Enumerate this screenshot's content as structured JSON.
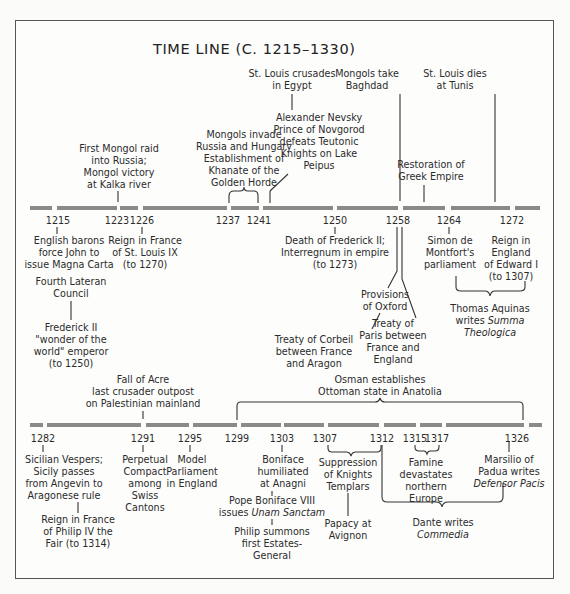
{
  "title": "TIME LINE (C. 1215–1330)",
  "timeline_1": {
    "years": [
      "1215",
      "1223",
      "1226",
      "1237",
      "1241",
      "1250",
      "1258",
      "1264",
      "1272"
    ],
    "above": {
      "mongol_raid": [
        "First Mongol raid",
        "into Russia;",
        "Mongol victory",
        "at Kalka river"
      ],
      "mongols_invade": [
        "Mongols invade",
        "Russia and Hungary",
        "Establishment of",
        "Khanate of the",
        "Golden Horde"
      ],
      "nevsky": [
        "Alexander Nevsky",
        "Prince of Novgorod",
        "defeats Teutonic",
        "Knights on Lake",
        "Peipus"
      ],
      "st_louis_egypt": [
        "St. Louis crusades",
        "in Egypt"
      ],
      "mongols_baghdad": [
        "Mongols take",
        "Baghdad"
      ],
      "greek_empire": [
        "Restoration of",
        "Greek Empire"
      ],
      "st_louis_tunis": [
        "St. Louis dies",
        "at Tunis"
      ]
    },
    "below": {
      "magna_carta": [
        "English barons",
        "force John to",
        "issue Magna Carta"
      ],
      "lateran": [
        "Fourth Lateran",
        "Council"
      ],
      "frederick": [
        "Frederick II",
        "\"wonder of the",
        "world\" emperor",
        "(to 1250)"
      ],
      "st_louis_reign": [
        "Reign in France",
        "of St. Louis IX",
        "(to 1270)"
      ],
      "death_frederick": [
        "Death of Frederick II;",
        "Interregnum in empire",
        "(to 1273)"
      ],
      "oxford": [
        "Provisions",
        "of Oxford"
      ],
      "corbeil": [
        "Treaty of Corbeil",
        "between France",
        "and Aragon"
      ],
      "paris": [
        "Treaty of",
        "Paris between",
        "France and",
        "England"
      ],
      "montfort": [
        "Simon de",
        "Montfort's",
        "parliament"
      ],
      "edward": [
        "Reign in",
        "England",
        "of Edward I",
        "(to 1307)"
      ],
      "aquinas": [
        "Thomas Aquinas",
        "writes ",
        "Summa",
        "Theologica"
      ]
    }
  },
  "timeline_2": {
    "years": [
      "1282",
      "1291",
      "1295",
      "1299",
      "1303",
      "1307",
      "1312",
      "1315",
      "1317",
      "1326"
    ],
    "above": {
      "acre": [
        "Fall of Acre",
        "last crusader outpost",
        "on Palestinian mainland"
      ],
      "osman": [
        "Osman establishes",
        "Ottoman state in Anatolia"
      ]
    },
    "below": {
      "vespers": [
        "Sicilian Vespers;",
        "Sicily passes",
        "from Angevin to",
        "Aragonese rule"
      ],
      "philip_iv": [
        "Reign in France",
        "of Philip IV the",
        "Fair (to 1314)"
      ],
      "swiss": [
        "Perpetual",
        "Compact",
        "among",
        "Swiss",
        "Cantons"
      ],
      "model_parl": [
        "Model",
        "Parliament",
        "in England"
      ],
      "anagni": [
        "Boniface",
        "humiliated",
        "at Anagni"
      ],
      "unam": [
        "Pope Boniface VIII",
        "issues ",
        "Unam Sanctam"
      ],
      "estates": [
        "Philip summons",
        "first Estates-",
        "General"
      ],
      "templars": [
        "Suppression",
        "of  Knights",
        "Templars"
      ],
      "avignon": [
        "Papacy at",
        "Avignon"
      ],
      "famine": [
        "Famine",
        "devastates",
        "northern",
        "Europe"
      ],
      "marsilio": [
        "Marsilio of",
        "Padua writes",
        "Defensor Pacis"
      ],
      "dante": [
        "Dante writes",
        "Commedia"
      ]
    }
  },
  "colors": {
    "bar": "#8a8a8a",
    "ink": "#2b2b2b",
    "frame": "#555555"
  }
}
